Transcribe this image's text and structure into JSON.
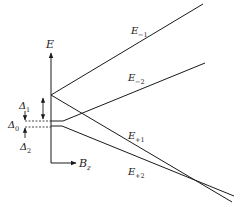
{
  "diagram": {
    "axes": {
      "y_label": "E",
      "x_label": "B",
      "x_label_sub": "z"
    },
    "levels": [
      {
        "id": "E-1",
        "label": "E",
        "sub": "−1"
      },
      {
        "id": "E-2",
        "label": "E",
        "sub": "−2"
      },
      {
        "id": "E+1",
        "label": "E",
        "sub": "+1"
      },
      {
        "id": "E+2",
        "label": "E",
        "sub": "+2"
      }
    ],
    "gaps": [
      {
        "label": "Δ",
        "sub": "1"
      },
      {
        "label": "Δ",
        "sub": "0"
      },
      {
        "label": "Δ",
        "sub": "2"
      }
    ],
    "line_color": "#1a1a1a"
  }
}
